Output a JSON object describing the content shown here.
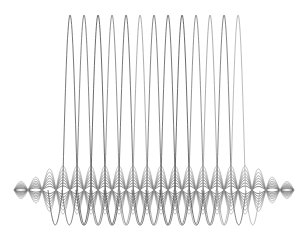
{
  "chart_data": {
    "type": "line",
    "title": "",
    "xlabel": "",
    "ylabel": "",
    "grid": false,
    "legend": null,
    "baseline_y": 190,
    "period_px": 14,
    "tall_waves": {
      "peak_x": [
        70,
        84,
        98,
        112,
        126,
        140,
        154,
        168,
        182,
        196,
        210,
        224,
        238
      ],
      "peak_y": 15,
      "trough_y": 225,
      "x_start": 60,
      "x_end": 245
    },
    "band": {
      "x_start": 14,
      "x_end": 294,
      "lobe_centers_start": 21,
      "amplitudes": [
        4,
        7,
        10,
        13,
        16,
        20,
        24
      ],
      "colors": [
        "#222222",
        "#444444",
        "#555555",
        "#666666",
        "#777777",
        "#888888",
        "#999999"
      ]
    },
    "stroke_colors": [
      "#555555",
      "#666666",
      "#444444",
      "#777777",
      "#555555",
      "#999999",
      "#666666",
      "#555555",
      "#444444",
      "#777777",
      "#999999",
      "#666666",
      "#aaaaaa"
    ]
  }
}
